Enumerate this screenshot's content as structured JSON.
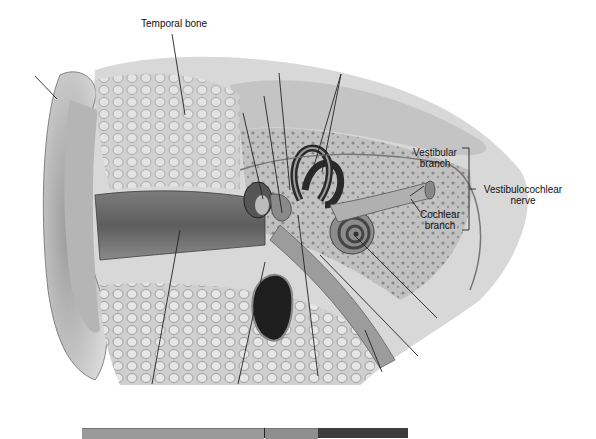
{
  "diagram": {
    "labels": {
      "temporal_bone": "Temporal bone",
      "vestibular_branch_line1": "Vestibular",
      "vestibular_branch_line2": "branch",
      "cochlear_branch_line1": "Cochlear",
      "cochlear_branch_line2": "branch",
      "nerve_line1": "Vestibulocochlear",
      "nerve_line2": "nerve"
    },
    "leader_lines_unlabeled": 12,
    "bottom_bar": {
      "segments": [
        {
          "name": "segment-1",
          "color": "#9a9a9a",
          "x": 82,
          "width": 182
        },
        {
          "name": "segment-2",
          "color": "#8f8f8f",
          "x": 265,
          "width": 53
        },
        {
          "name": "segment-3",
          "color": "#3c3c3c",
          "x": 318,
          "width": 90
        }
      ]
    }
  }
}
